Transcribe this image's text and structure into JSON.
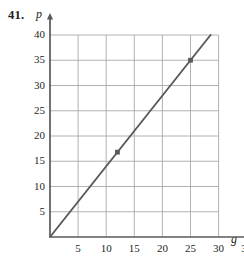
{
  "figure": {
    "problem_number": "41.",
    "x_axis_label": "g",
    "y_axis_label": "p"
  },
  "chart_data": {
    "type": "line",
    "title": "",
    "xlabel": "g",
    "ylabel": "p",
    "xlim": [
      0,
      30
    ],
    "ylim": [
      0,
      40
    ],
    "xticks": [
      5,
      10,
      15,
      20,
      25,
      30,
      35
    ],
    "yticks": [
      5,
      10,
      15,
      20,
      25,
      30,
      35,
      40
    ],
    "xtick_labels": [
      "5",
      "10",
      "15",
      "20",
      "25",
      "30",
      "35"
    ],
    "ytick_labels": [
      "5",
      "10",
      "15",
      "20",
      "25",
      "30",
      "35",
      "40"
    ],
    "grid": true,
    "grid_x_range": [
      0,
      30
    ],
    "grid_y_range": [
      0,
      40
    ],
    "axis_arrows": true,
    "legend": "none",
    "series": [
      {
        "name": "line",
        "type": "line",
        "slope": 1.4,
        "intercept": 0,
        "x": [
          0,
          28.57
        ],
        "values": [
          0,
          40
        ]
      },
      {
        "name": "plotted-points",
        "type": "scatter",
        "x": [
          12,
          25
        ],
        "values": [
          16.8,
          35
        ]
      }
    ],
    "colors": {
      "line": "#58595b",
      "grid": "#a7a9ac",
      "axis": "#58595b",
      "point": "#58595b",
      "text": "#231f20"
    }
  },
  "ticks": {
    "y": [
      {
        "label": "40",
        "value": 40
      },
      {
        "label": "35",
        "value": 35
      },
      {
        "label": "30",
        "value": 30
      },
      {
        "label": "25",
        "value": 25
      },
      {
        "label": "20",
        "value": 20
      },
      {
        "label": "15",
        "value": 15
      },
      {
        "label": "10",
        "value": 10
      },
      {
        "label": "5",
        "value": 5
      }
    ],
    "x": [
      {
        "label": "5",
        "value": 5
      },
      {
        "label": "10",
        "value": 10
      },
      {
        "label": "15",
        "value": 15
      },
      {
        "label": "20",
        "value": 20
      },
      {
        "label": "25",
        "value": 25
      },
      {
        "label": "30",
        "value": 30
      },
      {
        "label": "35",
        "value": 35
      }
    ]
  }
}
